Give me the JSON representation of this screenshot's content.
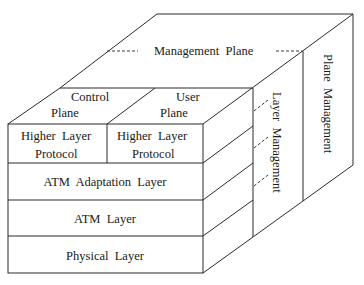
{
  "diagram": {
    "management_plane": "Management  Plane",
    "plane_management": "Plane  Management",
    "layer_management": "Layer  Management",
    "control_plane": {
      "line1": "Control",
      "line2": "Plane"
    },
    "user_plane": {
      "line1": "User",
      "line2": "Plane"
    },
    "higher_layer_control": {
      "line1": "Higher  Layer",
      "line2": "Protocol"
    },
    "higher_layer_user": {
      "line1": "Higher  Layer",
      "line2": "Protocol"
    },
    "layers": [
      {
        "label": "ATM  Adaptation  Layer"
      },
      {
        "label": "ATM  Layer"
      },
      {
        "label": "Physical  Layer"
      }
    ]
  }
}
